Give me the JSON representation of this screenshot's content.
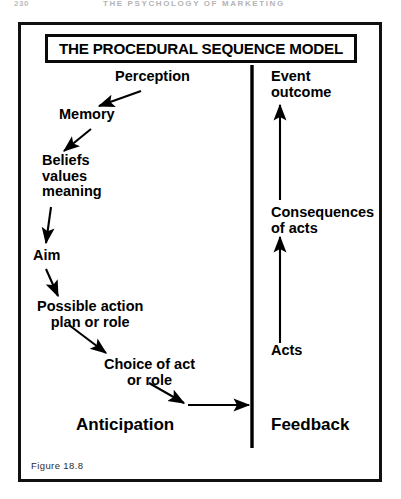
{
  "running_head": {
    "page_number": "230",
    "title": "THE PSYCHOLOGY OF MARKETING"
  },
  "figure": {
    "title": "THE PROCEDURAL SEQUENCE MODEL",
    "caption": "Figure  18.8",
    "colors": {
      "ink": "#000000",
      "frame": "#111111",
      "background": "#ffffff",
      "running_head": "#b4b4b4"
    },
    "left_column": {
      "heading": "Anticipation",
      "nodes": [
        {
          "id": "perception",
          "label": "Perception"
        },
        {
          "id": "memory",
          "label": "Memory"
        },
        {
          "id": "beliefs",
          "label": "Beliefs\nvalues\nmeaning"
        },
        {
          "id": "aim",
          "label": "Aim"
        },
        {
          "id": "possible-action",
          "label": "Possible action\nplan or role"
        },
        {
          "id": "choice-of-act",
          "label": "Choice of act\nor role"
        }
      ]
    },
    "right_column": {
      "heading": "Feedback",
      "nodes": [
        {
          "id": "event-outcome",
          "label": "Event\noutcome"
        },
        {
          "id": "consequences-of-acts",
          "label": "Consequences\nof acts"
        },
        {
          "id": "acts",
          "label": "Acts"
        }
      ]
    },
    "flow_arrows": [
      {
        "id": "perception-to-memory",
        "from": "perception",
        "to": "memory",
        "direction": "down-left"
      },
      {
        "id": "memory-to-beliefs",
        "from": "memory",
        "to": "beliefs",
        "direction": "down-left"
      },
      {
        "id": "beliefs-to-aim",
        "from": "beliefs",
        "to": "aim",
        "direction": "down"
      },
      {
        "id": "aim-to-possible-action",
        "from": "aim",
        "to": "possible-action",
        "direction": "down-right"
      },
      {
        "id": "possible-action-to-choice",
        "from": "possible-action",
        "to": "choice-of-act",
        "direction": "down-right"
      },
      {
        "id": "choice-to-divider",
        "from": "choice-of-act",
        "to": "feedback-divider",
        "direction": "right"
      },
      {
        "id": "acts-to-consequences",
        "from": "acts",
        "to": "consequences-of-acts",
        "direction": "up"
      },
      {
        "id": "consequences-to-event-outcome",
        "from": "consequences-of-acts",
        "to": "event-outcome",
        "direction": "up"
      }
    ],
    "divider": {
      "id": "anticipation-feedback-divider",
      "orientation": "vertical"
    }
  }
}
